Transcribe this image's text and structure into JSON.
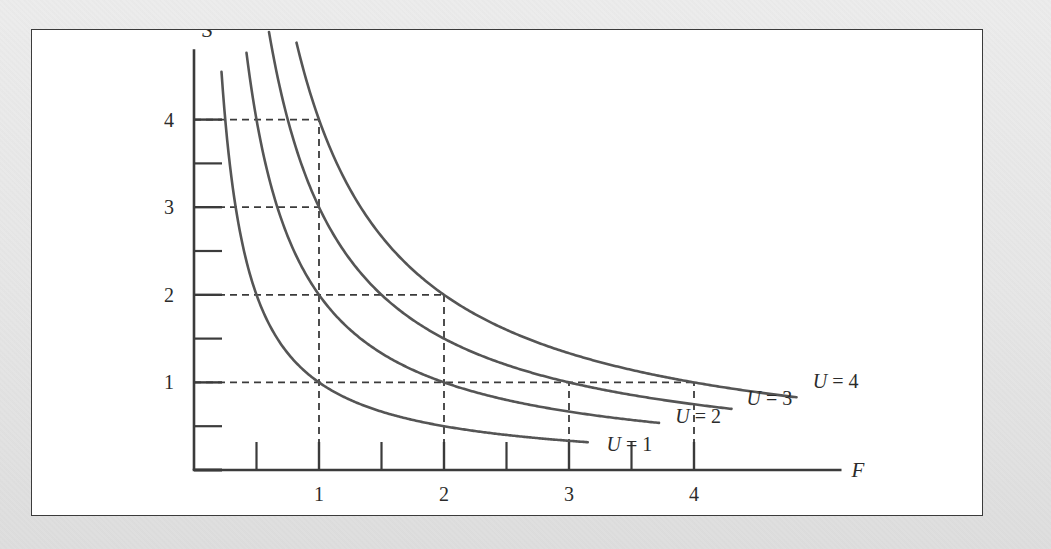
{
  "figure": {
    "background_color": "#e8e8e8",
    "panel_color": "#ffffff",
    "border_color": "#3b3b3b",
    "curve_color": "#555555",
    "axis_color": "#3b3b3b"
  },
  "chart_data": {
    "type": "line",
    "title": "",
    "subtitle": "",
    "xlabel": "F",
    "ylabel": "S",
    "xlim": [
      0,
      5.1
    ],
    "ylim": [
      0,
      4.85
    ],
    "grid": false,
    "legend_position": "right-inline",
    "x_major_ticks": [
      1,
      2,
      3,
      4
    ],
    "x_minor_ticks": [
      0.5,
      1.5,
      2.5,
      3.5
    ],
    "x_tick_labels": [
      "1",
      "2",
      "3",
      "4"
    ],
    "y_major_ticks": [
      1,
      2,
      3,
      4
    ],
    "y_minor_ticks": [
      0.5,
      1.5,
      2.5,
      3.5
    ],
    "y_tick_labels": [
      "1",
      "2",
      "3",
      "4"
    ],
    "series": [
      {
        "name": "U = 1",
        "label": "U = 1",
        "utility": 1,
        "formula": "S = 1/F",
        "x_start": 0.22,
        "x_end": 3.15,
        "label_x": 3.3,
        "label_y": 0.3,
        "points": [
          {
            "x": 0.25,
            "y": 4.0
          },
          {
            "x": 0.5,
            "y": 2.0
          },
          {
            "x": 1.0,
            "y": 1.0
          },
          {
            "x": 1.5,
            "y": 0.667
          },
          {
            "x": 2.0,
            "y": 0.5
          },
          {
            "x": 2.5,
            "y": 0.4
          },
          {
            "x": 3.0,
            "y": 0.333
          }
        ]
      },
      {
        "name": "U = 2",
        "label": "U = 2",
        "utility": 2,
        "formula": "S = 2/F",
        "x_start": 0.42,
        "x_end": 3.72,
        "label_x": 3.85,
        "label_y": 0.62,
        "points": [
          {
            "x": 0.45,
            "y": 4.44
          },
          {
            "x": 0.5,
            "y": 4.0
          },
          {
            "x": 1.0,
            "y": 2.0
          },
          {
            "x": 1.5,
            "y": 1.333
          },
          {
            "x": 2.0,
            "y": 1.0
          },
          {
            "x": 3.0,
            "y": 0.667
          },
          {
            "x": 3.7,
            "y": 0.54
          }
        ]
      },
      {
        "name": "U = 3",
        "label": "U = 3",
        "utility": 3,
        "formula": "S = 3/F",
        "x_start": 0.6,
        "x_end": 4.3,
        "label_x": 4.42,
        "label_y": 0.82,
        "points": [
          {
            "x": 0.63,
            "y": 4.76
          },
          {
            "x": 0.75,
            "y": 4.0
          },
          {
            "x": 1.0,
            "y": 3.0
          },
          {
            "x": 1.5,
            "y": 2.0
          },
          {
            "x": 2.0,
            "y": 1.5
          },
          {
            "x": 3.0,
            "y": 1.0
          },
          {
            "x": 4.0,
            "y": 0.75
          }
        ]
      },
      {
        "name": "U = 4",
        "label": "U = 4",
        "utility": 4,
        "formula": "S = 4/F",
        "x_start": 0.82,
        "x_end": 4.82,
        "label_x": 4.95,
        "label_y": 1.02,
        "points": [
          {
            "x": 0.84,
            "y": 4.76
          },
          {
            "x": 1.0,
            "y": 4.0
          },
          {
            "x": 1.5,
            "y": 2.667
          },
          {
            "x": 2.0,
            "y": 2.0
          },
          {
            "x": 3.0,
            "y": 1.333
          },
          {
            "x": 4.0,
            "y": 1.0
          },
          {
            "x": 4.8,
            "y": 0.833
          }
        ]
      }
    ],
    "construction_lines": {
      "style": "dashed",
      "marked_points": [
        {
          "x": 1,
          "y": 4,
          "curve": "U = 4"
        },
        {
          "x": 1,
          "y": 3,
          "curve": "U = 3"
        },
        {
          "x": 1,
          "y": 2,
          "curve": "U = 2"
        },
        {
          "x": 1,
          "y": 1,
          "curve": "U = 1"
        },
        {
          "x": 2,
          "y": 2,
          "curve": "U = 4"
        },
        {
          "x": 2,
          "y": 1,
          "curve": "U = 2"
        },
        {
          "x": 3,
          "y": 1,
          "curve": "U = 3"
        },
        {
          "x": 4,
          "y": 1,
          "curve": "U = 4"
        }
      ],
      "horizontal": [
        {
          "y": 4,
          "x_from": 0,
          "x_to": 1
        },
        {
          "y": 3,
          "x_from": 0,
          "x_to": 1
        },
        {
          "y": 2,
          "x_from": 0,
          "x_to": 2
        },
        {
          "y": 1,
          "x_from": 0,
          "x_to": 4
        }
      ],
      "vertical": [
        {
          "x": 1,
          "y_from": 0,
          "y_to": 4
        },
        {
          "x": 2,
          "y_from": 0,
          "y_to": 2
        },
        {
          "x": 3,
          "y_from": 0,
          "y_to": 1
        },
        {
          "x": 4,
          "y_from": 0,
          "y_to": 1
        }
      ]
    }
  }
}
